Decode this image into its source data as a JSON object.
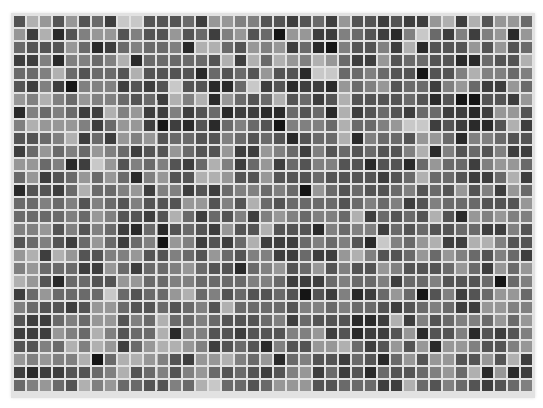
{
  "mosaic": {
    "rows": 29,
    "columns": 40,
    "cell_size_px": 11,
    "gap_px": 2,
    "gap_color": "#e2e2e2",
    "palette": [
      "#151515",
      "#2a2a2a",
      "#3e3e3e",
      "#545454",
      "#6a6a6a",
      "#808080",
      "#979797",
      "#b0b0b0",
      "#c8c8c8",
      "#dcdcdc"
    ],
    "levels": [
      [
        3,
        7,
        6,
        3,
        6,
        3,
        4,
        2,
        8,
        8,
        3,
        3,
        3,
        4,
        2,
        6,
        6,
        5,
        5,
        3,
        3,
        2,
        3,
        4,
        2,
        6,
        3,
        3,
        2,
        3,
        2,
        2,
        6,
        7,
        2,
        7,
        3,
        6,
        6,
        4
      ],
      [
        6,
        2,
        7,
        1,
        3,
        5,
        6,
        6,
        3,
        5,
        3,
        3,
        6,
        3,
        4,
        2,
        5,
        6,
        3,
        4,
        0,
        6,
        6,
        2,
        2,
        5,
        4,
        3,
        2,
        1,
        5,
        8,
        4,
        2,
        5,
        2,
        5,
        6,
        1,
        6
      ],
      [
        4,
        3,
        3,
        3,
        6,
        4,
        1,
        2,
        4,
        5,
        4,
        4,
        5,
        1,
        7,
        7,
        4,
        3,
        6,
        5,
        6,
        2,
        4,
        1,
        0,
        5,
        3,
        3,
        5,
        2,
        7,
        1,
        3,
        3,
        3,
        6,
        3,
        6,
        3,
        4
      ],
      [
        2,
        2,
        5,
        1,
        5,
        5,
        4,
        5,
        7,
        1,
        4,
        4,
        4,
        4,
        4,
        3,
        7,
        2,
        7,
        4,
        7,
        6,
        5,
        7,
        6,
        4,
        2,
        2,
        6,
        3,
        4,
        4,
        3,
        3,
        1,
        1,
        4,
        3,
        3,
        7
      ],
      [
        4,
        4,
        5,
        7,
        4,
        3,
        4,
        4,
        3,
        7,
        3,
        3,
        3,
        3,
        1,
        4,
        3,
        4,
        3,
        6,
        3,
        3,
        1,
        8,
        8,
        4,
        4,
        5,
        4,
        3,
        3,
        0,
        3,
        3,
        5,
        7,
        5,
        5,
        4,
        5
      ],
      [
        3,
        2,
        5,
        2,
        0,
        5,
        5,
        5,
        2,
        3,
        2,
        3,
        8,
        3,
        3,
        1,
        1,
        4,
        8,
        2,
        3,
        1,
        2,
        2,
        1,
        6,
        4,
        5,
        6,
        3,
        4,
        4,
        2,
        5,
        6,
        4,
        2,
        2,
        6,
        4
      ],
      [
        6,
        5,
        7,
        5,
        4,
        6,
        5,
        5,
        4,
        3,
        4,
        2,
        7,
        5,
        7,
        1,
        6,
        4,
        3,
        4,
        7,
        3,
        4,
        2,
        3,
        7,
        3,
        3,
        3,
        3,
        4,
        3,
        1,
        3,
        0,
        0,
        3,
        3,
        2,
        6
      ],
      [
        1,
        5,
        4,
        5,
        4,
        2,
        2,
        7,
        5,
        6,
        2,
        2,
        5,
        2,
        3,
        4,
        1,
        2,
        2,
        1,
        1,
        4,
        3,
        4,
        1,
        7,
        2,
        3,
        4,
        3,
        2,
        4,
        4,
        2,
        2,
        1,
        2,
        6,
        6,
        3
      ],
      [
        5,
        7,
        6,
        6,
        6,
        5,
        2,
        4,
        6,
        6,
        2,
        0,
        2,
        1,
        3,
        1,
        4,
        5,
        4,
        3,
        0,
        5,
        5,
        5,
        4,
        7,
        4,
        4,
        5,
        6,
        8,
        8,
        2,
        3,
        2,
        1,
        1,
        3,
        7,
        2
      ],
      [
        3,
        3,
        4,
        5,
        7,
        2,
        4,
        2,
        6,
        5,
        6,
        3,
        4,
        4,
        3,
        3,
        5,
        4,
        3,
        4,
        3,
        1,
        3,
        4,
        4,
        7,
        1,
        5,
        4,
        4,
        3,
        6,
        6,
        4,
        1,
        5,
        5,
        4,
        3,
        3
      ],
      [
        2,
        4,
        6,
        4,
        5,
        4,
        6,
        5,
        4,
        2,
        3,
        3,
        6,
        4,
        3,
        3,
        6,
        2,
        2,
        6,
        5,
        4,
        2,
        5,
        3,
        4,
        3,
        4,
        3,
        3,
        5,
        7,
        1,
        5,
        3,
        4,
        3,
        5,
        2,
        2
      ],
      [
        6,
        6,
        4,
        5,
        1,
        2,
        8,
        6,
        3,
        5,
        4,
        5,
        3,
        2,
        4,
        7,
        5,
        2,
        4,
        6,
        2,
        4,
        3,
        5,
        5,
        3,
        3,
        1,
        3,
        3,
        1,
        4,
        6,
        4,
        4,
        2,
        5,
        6,
        6,
        4
      ],
      [
        4,
        6,
        2,
        3,
        4,
        6,
        4,
        6,
        4,
        1,
        5,
        6,
        3,
        3,
        7,
        7,
        6,
        3,
        3,
        6,
        3,
        3,
        3,
        4,
        3,
        3,
        3,
        3,
        2,
        3,
        4,
        7,
        4,
        4,
        3,
        2,
        2,
        4,
        7,
        2
      ],
      [
        1,
        3,
        3,
        2,
        4,
        7,
        4,
        4,
        5,
        6,
        2,
        5,
        5,
        2,
        3,
        2,
        4,
        5,
        5,
        4,
        5,
        4,
        0,
        6,
        4,
        3,
        4,
        3,
        3,
        4,
        5,
        3,
        4,
        3,
        6,
        3,
        5,
        2,
        6,
        4
      ],
      [
        4,
        4,
        5,
        4,
        5,
        3,
        5,
        4,
        3,
        5,
        3,
        3,
        3,
        6,
        6,
        3,
        5,
        3,
        7,
        4,
        3,
        4,
        4,
        4,
        4,
        3,
        4,
        5,
        4,
        5,
        2,
        3,
        5,
        4,
        4,
        4,
        3,
        3,
        3,
        6
      ],
      [
        4,
        4,
        4,
        4,
        5,
        4,
        6,
        5,
        3,
        3,
        2,
        3,
        7,
        4,
        2,
        4,
        3,
        5,
        2,
        5,
        6,
        5,
        4,
        5,
        5,
        4,
        7,
        2,
        4,
        3,
        4,
        3,
        7,
        3,
        1,
        6,
        5,
        6,
        5,
        5
      ],
      [
        5,
        5,
        6,
        3,
        5,
        3,
        5,
        4,
        2,
        1,
        4,
        1,
        3,
        4,
        3,
        2,
        6,
        3,
        3,
        7,
        3,
        3,
        3,
        1,
        5,
        4,
        5,
        5,
        2,
        4,
        3,
        4,
        3,
        3,
        4,
        4,
        2,
        2,
        5,
        3
      ],
      [
        3,
        4,
        5,
        3,
        2,
        4,
        6,
        4,
        2,
        4,
        5,
        0,
        6,
        5,
        2,
        3,
        2,
        4,
        7,
        2,
        2,
        2,
        4,
        5,
        4,
        5,
        3,
        1,
        8,
        5,
        4,
        6,
        7,
        2,
        2,
        7,
        7,
        5,
        3,
        3
      ],
      [
        6,
        7,
        2,
        7,
        6,
        3,
        3,
        5,
        5,
        6,
        3,
        3,
        5,
        4,
        3,
        6,
        4,
        3,
        5,
        5,
        2,
        2,
        4,
        2,
        2,
        6,
        7,
        5,
        3,
        3,
        4,
        6,
        4,
        6,
        5,
        4,
        3,
        5,
        4,
        2
      ],
      [
        5,
        6,
        4,
        4,
        4,
        2,
        2,
        6,
        4,
        2,
        4,
        4,
        5,
        6,
        4,
        3,
        3,
        1,
        4,
        5,
        6,
        3,
        4,
        6,
        3,
        5,
        3,
        3,
        6,
        5,
        3,
        3,
        3,
        4,
        6,
        4,
        2,
        6,
        4,
        6
      ],
      [
        7,
        6,
        3,
        1,
        4,
        4,
        3,
        3,
        6,
        6,
        4,
        4,
        5,
        5,
        4,
        4,
        4,
        4,
        5,
        5,
        4,
        2,
        2,
        2,
        4,
        5,
        4,
        4,
        5,
        2,
        4,
        4,
        5,
        3,
        3,
        3,
        4,
        0,
        4,
        5
      ],
      [
        2,
        4,
        6,
        4,
        4,
        4,
        4,
        8,
        4,
        3,
        4,
        4,
        6,
        7,
        4,
        5,
        3,
        4,
        3,
        3,
        4,
        3,
        0,
        3,
        2,
        5,
        1,
        2,
        4,
        6,
        4,
        0,
        3,
        5,
        2,
        3,
        4,
        6,
        6,
        4
      ],
      [
        5,
        4,
        3,
        3,
        2,
        3,
        6,
        6,
        4,
        3,
        3,
        4,
        3,
        4,
        5,
        3,
        7,
        4,
        4,
        4,
        4,
        3,
        5,
        5,
        4,
        5,
        4,
        4,
        3,
        2,
        3,
        4,
        5,
        4,
        2,
        2,
        6,
        6,
        5,
        5
      ],
      [
        3,
        2,
        2,
        4,
        5,
        4,
        6,
        6,
        3,
        5,
        4,
        7,
        4,
        4,
        5,
        4,
        3,
        3,
        3,
        4,
        5,
        2,
        4,
        3,
        3,
        3,
        1,
        1,
        2,
        7,
        2,
        5,
        3,
        4,
        5,
        5,
        4,
        6,
        4,
        6
      ],
      [
        2,
        2,
        2,
        6,
        5,
        4,
        7,
        5,
        3,
        4,
        4,
        7,
        1,
        5,
        5,
        3,
        3,
        2,
        3,
        3,
        3,
        5,
        5,
        6,
        2,
        3,
        1,
        2,
        2,
        3,
        6,
        1,
        3,
        3,
        5,
        1,
        3,
        2,
        3,
        5
      ],
      [
        3,
        3,
        5,
        4,
        7,
        5,
        7,
        6,
        2,
        4,
        6,
        7,
        7,
        6,
        5,
        2,
        3,
        4,
        3,
        1,
        5,
        3,
        3,
        6,
        6,
        7,
        4,
        2,
        3,
        6,
        3,
        6,
        1,
        6,
        6,
        5,
        3,
        3,
        5,
        6
      ],
      [
        6,
        5,
        6,
        5,
        5,
        7,
        0,
        4,
        7,
        7,
        6,
        5,
        3,
        2,
        6,
        6,
        7,
        5,
        4,
        6,
        1,
        4,
        5,
        3,
        3,
        2,
        4,
        3,
        1,
        4,
        6,
        3,
        6,
        6,
        3,
        3,
        6,
        3,
        7,
        2
      ],
      [
        2,
        1,
        2,
        2,
        3,
        3,
        4,
        5,
        7,
        3,
        4,
        5,
        3,
        5,
        6,
        4,
        3,
        4,
        3,
        2,
        3,
        5,
        6,
        2,
        4,
        2,
        3,
        1,
        4,
        3,
        3,
        4,
        5,
        6,
        4,
        7,
        1,
        6,
        1,
        2
      ],
      [
        4,
        5,
        6,
        4,
        3,
        7,
        5,
        6,
        4,
        4,
        3,
        3,
        5,
        4,
        7,
        8,
        4,
        4,
        3,
        4,
        6,
        6,
        6,
        3,
        3,
        4,
        4,
        4,
        2,
        2,
        7,
        4,
        3,
        5,
        4,
        3,
        2,
        3,
        4,
        5
      ]
    ]
  }
}
